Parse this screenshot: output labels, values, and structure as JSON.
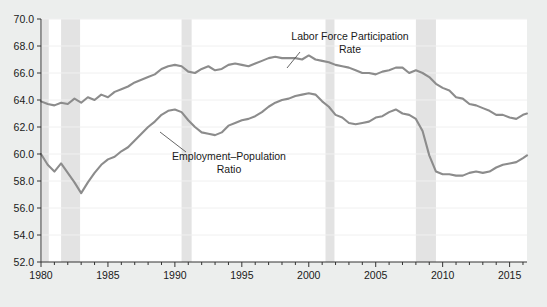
{
  "chart_data": {
    "type": "line",
    "title": "",
    "xlabel": "",
    "ylabel": "",
    "xlim": [
      1980.0,
      2016.3
    ],
    "ylim": [
      52.0,
      70.0
    ],
    "grid": true,
    "legend_position": "inline-annotations",
    "xticks": [
      1980,
      1985,
      1990,
      1995,
      2000,
      2005,
      2010,
      2015
    ],
    "xticklabels": [
      "1980",
      "1985",
      "1990",
      "1995",
      "2000",
      "2005",
      "2010",
      "2015"
    ],
    "xminor_tick_interval": 1,
    "yticks": [
      52.0,
      54.0,
      56.0,
      58.0,
      60.0,
      62.0,
      64.0,
      66.0,
      68.0,
      70.0
    ],
    "yticklabels": [
      "52.0",
      "54.0",
      "56.0",
      "58.0",
      "60.0",
      "62.0",
      "64.0",
      "66.0",
      "68.0",
      "70.0"
    ],
    "annotations": [
      {
        "name": "lfpr-label",
        "text_lines": [
          "Labor Force Participation",
          "Rate"
        ],
        "x_px": 350,
        "y_px": 40,
        "leader_from": [
          300,
          52
        ],
        "leader_to": [
          287,
          68
        ]
      },
      {
        "name": "epop-label",
        "text_lines": [
          "Employment–Population",
          "Ratio"
        ],
        "x_px": 229,
        "y_px": 160,
        "leader_from": [
          186,
          152
        ],
        "leader_to": [
          160,
          132
        ]
      }
    ],
    "recession_bands": [
      {
        "name": "recession-1980",
        "start": 1980.08,
        "end": 1980.58
      },
      {
        "name": "recession-1981-82",
        "start": 1981.5,
        "end": 1982.92
      },
      {
        "name": "recession-1990-91",
        "start": 1990.5,
        "end": 1991.25
      },
      {
        "name": "recession-2001",
        "start": 2001.25,
        "end": 2001.92
      },
      {
        "name": "recession-2007-09",
        "start": 2008.0,
        "end": 2009.5
      }
    ],
    "series": [
      {
        "name": "Labor Force Participation Rate",
        "color": "#8c8c8c",
        "x": [
          1980.0,
          1980.5,
          1981.0,
          1981.5,
          1982.0,
          1982.5,
          1983.0,
          1983.5,
          1984.0,
          1984.5,
          1985.0,
          1985.5,
          1986.0,
          1986.5,
          1987.0,
          1987.5,
          1988.0,
          1988.5,
          1989.0,
          1989.5,
          1990.0,
          1990.5,
          1991.0,
          1991.5,
          1992.0,
          1992.5,
          1993.0,
          1993.5,
          1994.0,
          1994.5,
          1995.0,
          1995.5,
          1996.0,
          1996.5,
          1997.0,
          1997.5,
          1998.0,
          1998.5,
          1999.0,
          1999.5,
          2000.0,
          2000.5,
          2001.0,
          2001.5,
          2002.0,
          2002.5,
          2003.0,
          2003.5,
          2004.0,
          2004.5,
          2005.0,
          2005.5,
          2006.0,
          2006.5,
          2007.0,
          2007.5,
          2008.0,
          2008.5,
          2009.0,
          2009.5,
          2010.0,
          2010.5,
          2011.0,
          2011.5,
          2012.0,
          2012.5,
          2013.0,
          2013.5,
          2014.0,
          2014.5,
          2015.0,
          2015.5,
          2016.0,
          2016.3
        ],
        "y": [
          63.9,
          63.7,
          63.6,
          63.8,
          63.7,
          64.1,
          63.8,
          64.2,
          64.0,
          64.4,
          64.2,
          64.6,
          64.8,
          65.0,
          65.3,
          65.5,
          65.7,
          65.9,
          66.3,
          66.5,
          66.6,
          66.5,
          66.1,
          66.0,
          66.3,
          66.5,
          66.2,
          66.3,
          66.6,
          66.7,
          66.6,
          66.5,
          66.7,
          66.9,
          67.1,
          67.2,
          67.1,
          67.1,
          67.1,
          67.0,
          67.3,
          67.0,
          66.9,
          66.8,
          66.6,
          66.5,
          66.4,
          66.2,
          66.0,
          66.0,
          65.9,
          66.1,
          66.2,
          66.4,
          66.4,
          66.0,
          66.2,
          66.0,
          65.7,
          65.2,
          64.9,
          64.7,
          64.2,
          64.1,
          63.7,
          63.6,
          63.4,
          63.2,
          62.9,
          62.9,
          62.7,
          62.6,
          62.9,
          63.0
        ]
      },
      {
        "name": "Employment-Population Ratio",
        "color": "#8c8c8c",
        "x": [
          1980.0,
          1980.5,
          1981.0,
          1981.5,
          1982.0,
          1982.5,
          1983.0,
          1983.5,
          1984.0,
          1984.5,
          1985.0,
          1985.5,
          1986.0,
          1986.5,
          1987.0,
          1987.5,
          1988.0,
          1988.5,
          1989.0,
          1989.5,
          1990.0,
          1990.5,
          1991.0,
          1991.5,
          1992.0,
          1992.5,
          1993.0,
          1993.5,
          1994.0,
          1994.5,
          1995.0,
          1995.5,
          1996.0,
          1996.5,
          1997.0,
          1997.5,
          1998.0,
          1998.5,
          1999.0,
          1999.5,
          2000.0,
          2000.5,
          2001.0,
          2001.5,
          2002.0,
          2002.5,
          2003.0,
          2003.5,
          2004.0,
          2004.5,
          2005.0,
          2005.5,
          2006.0,
          2006.5,
          2007.0,
          2007.5,
          2008.0,
          2008.5,
          2009.0,
          2009.5,
          2010.0,
          2010.5,
          2011.0,
          2011.5,
          2012.0,
          2012.5,
          2013.0,
          2013.5,
          2014.0,
          2014.5,
          2015.0,
          2015.5,
          2016.0,
          2016.3
        ],
        "y": [
          60.0,
          59.2,
          58.7,
          59.3,
          58.6,
          57.9,
          57.1,
          57.9,
          58.6,
          59.2,
          59.6,
          59.8,
          60.2,
          60.5,
          61.0,
          61.5,
          62.0,
          62.4,
          62.9,
          63.2,
          63.3,
          63.1,
          62.5,
          62.0,
          61.6,
          61.5,
          61.4,
          61.6,
          62.1,
          62.3,
          62.5,
          62.6,
          62.8,
          63.1,
          63.5,
          63.8,
          64.0,
          64.1,
          64.3,
          64.4,
          64.5,
          64.4,
          63.9,
          63.5,
          62.9,
          62.7,
          62.3,
          62.2,
          62.3,
          62.4,
          62.7,
          62.8,
          63.1,
          63.3,
          63.0,
          62.9,
          62.6,
          61.7,
          59.9,
          58.7,
          58.5,
          58.5,
          58.4,
          58.4,
          58.6,
          58.7,
          58.6,
          58.7,
          59.0,
          59.2,
          59.3,
          59.4,
          59.7,
          59.9
        ]
      }
    ]
  },
  "plot_geometry": {
    "left": 41,
    "right": 527,
    "top": 19,
    "bottom": 262
  },
  "colors": {
    "background": "#eceeed",
    "plot_background": "#ffffff",
    "line": "#8c8c8c",
    "recession_band": "#e3e3e3",
    "gridline": "#f0f0f0",
    "axis": "#333333",
    "text": "#1a1a1a"
  }
}
